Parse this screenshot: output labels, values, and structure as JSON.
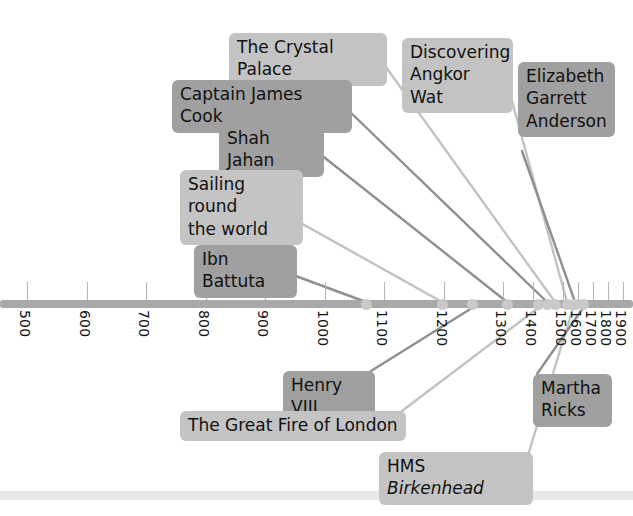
{
  "figure": {
    "kind": "historical-timeline",
    "width": 633,
    "height": 516
  },
  "colors": {
    "axis_bar": "#a9a9a9",
    "axis_dot": "#c9c9c9",
    "tick": "#b4b4b4",
    "label_dark": "#a0a0a0",
    "label_light": "#c4c4c4",
    "connector_dark": "#8f8f8f",
    "connector_light": "#c2c2c2",
    "text": "#111111",
    "footer_rule": "#e8e8e8"
  },
  "axis": {
    "name": "year-axis",
    "tick_labels": [
      "500",
      "600",
      "700",
      "800",
      "900",
      "1000",
      "1100",
      "1200",
      "1300",
      "1400",
      "1500",
      "1600",
      "1700",
      "1800",
      "1900"
    ],
    "tick_values": [
      500,
      600,
      700,
      800,
      900,
      1000,
      1100,
      1200,
      1300,
      1400,
      1500,
      1600,
      1700,
      1800,
      1900
    ],
    "tick_x": [
      27,
      87,
      146,
      206,
      265,
      325,
      384,
      444,
      503,
      533,
      563,
      578,
      593,
      608,
      623
    ],
    "label_rotation_deg": 90,
    "bar_y": 300,
    "bar_height": 8,
    "bar_left": 0,
    "bar_right": 633
  },
  "events": [
    {
      "name": "the-crystal-palace",
      "label": "The Crystal Palace",
      "shade": "light",
      "box": {
        "left": 229,
        "top": 33,
        "width": 158,
        "height": 30
      },
      "anchor_x": 555,
      "connector_shade": "light"
    },
    {
      "name": "captain-james-cook",
      "label": "Captain James Cook",
      "shade": "dark",
      "box": {
        "left": 172,
        "top": 80,
        "width": 180,
        "height": 30
      },
      "anchor_x": 547,
      "connector_shade": "dark"
    },
    {
      "name": "shah-jahan",
      "label": "Shah Jahan",
      "shade": "dark",
      "box": {
        "left": 219,
        "top": 124,
        "width": 105,
        "height": 30
      },
      "anchor_x": 507,
      "connector_shade": "dark"
    },
    {
      "name": "sailing-round-the-world",
      "label": "Sailing round\nthe world",
      "label_lines": [
        "Sailing round",
        "the world"
      ],
      "shade": "light",
      "box": {
        "left": 180,
        "top": 170,
        "width": 123,
        "height": 52
      },
      "anchor_x": 442,
      "connector_shade": "light"
    },
    {
      "name": "ibn-battuta",
      "label": "Ibn Battuta",
      "shade": "dark",
      "box": {
        "left": 194,
        "top": 245,
        "width": 103,
        "height": 30
      },
      "anchor_x": 366,
      "connector_shade": "dark"
    },
    {
      "name": "discovering-angkor-wat",
      "label": "Discovering\nAngkor Wat",
      "label_lines": [
        "Discovering",
        "Angkor Wat"
      ],
      "shade": "light",
      "box": {
        "left": 402,
        "top": 38,
        "width": 111,
        "height": 52
      },
      "anchor_x": 567,
      "connector_shade": "light"
    },
    {
      "name": "elizabeth-garrett-anderson",
      "label": "Elizabeth\nGarrett\nAnderson",
      "label_lines": [
        "Elizabeth",
        "Garrett",
        "Anderson"
      ],
      "shade": "dark",
      "box": {
        "left": 518,
        "top": 62,
        "width": 97,
        "height": 89
      },
      "anchor_x": 575,
      "connector_shade": "dark"
    },
    {
      "name": "henry-viii",
      "label": "Henry VIII",
      "shade": "dark",
      "box": {
        "left": 283,
        "top": 371,
        "width": 92,
        "height": 30
      },
      "anchor_x": 472,
      "connector_shade": "dark"
    },
    {
      "name": "the-great-fire-of-london",
      "label": "The Great Fire of London",
      "shade": "light",
      "box": {
        "left": 180,
        "top": 411,
        "width": 226,
        "height": 30
      },
      "anchor_x": 538,
      "connector_shade": "light"
    },
    {
      "name": "hms-birkenhead",
      "label": "HMS Birkenhead",
      "label_prefix": "HMS ",
      "label_italic": "Birkenhead",
      "shade": "light",
      "box": {
        "left": 379,
        "top": 452,
        "width": 154,
        "height": 30
      },
      "anchor_x": 573,
      "connector_shade": "light"
    },
    {
      "name": "martha-ricks",
      "label": "Martha\nRicks",
      "label_lines": [
        "Martha",
        "Ricks"
      ],
      "shade": "dark",
      "box": {
        "left": 533,
        "top": 374,
        "width": 79,
        "height": 58
      },
      "anchor_x": 583,
      "connector_shade": "dark"
    }
  ],
  "axis_markers": [
    {
      "name": "marker-1350",
      "x": 366
    },
    {
      "name": "marker-1470",
      "x": 442
    },
    {
      "name": "marker-1500",
      "x": 472
    },
    {
      "name": "marker-1510",
      "x": 507
    },
    {
      "name": "marker-1600",
      "x": 538
    },
    {
      "name": "marker-1700",
      "x": 547
    },
    {
      "name": "marker-1760",
      "x": 555
    },
    {
      "name": "marker-1850",
      "x": 567
    },
    {
      "name": "marker-1860",
      "x": 573
    },
    {
      "name": "marker-1870",
      "x": 575
    },
    {
      "name": "marker-1880",
      "x": 583
    }
  ]
}
